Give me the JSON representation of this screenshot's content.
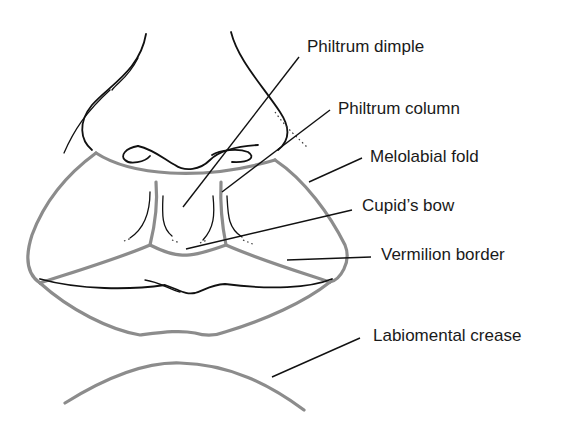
{
  "diagram": {
    "labels": [
      {
        "id": "philtrum-dimple",
        "text": "Philtrum dimple"
      },
      {
        "id": "philtrum-column",
        "text": "Philtrum column"
      },
      {
        "id": "melolabial-fold",
        "text": "Melolabial fold"
      },
      {
        "id": "cupids-bow",
        "text": "Cupid’s bow"
      },
      {
        "id": "vermilion-border",
        "text": "Vermilion border"
      },
      {
        "id": "labiomental-crease",
        "text": "Labiomental crease"
      }
    ],
    "colors": {
      "outline_gray": "#8c8c8c",
      "ink": "#111111",
      "background": "#ffffff"
    }
  }
}
